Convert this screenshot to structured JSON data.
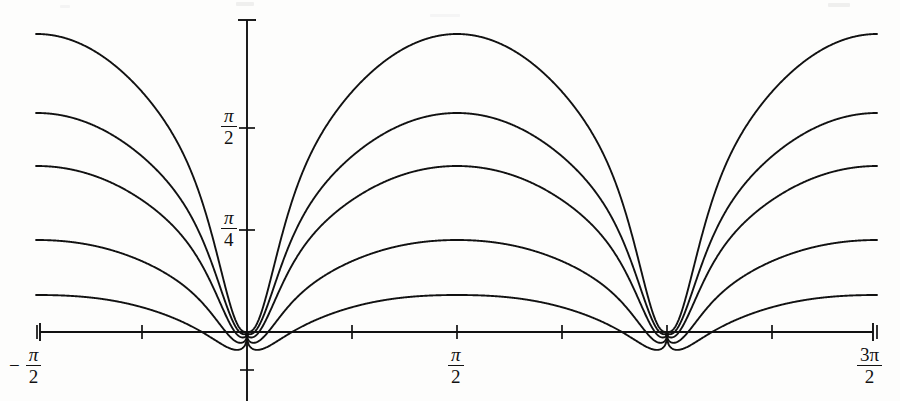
{
  "figure": {
    "background_color": "#fdfdfc",
    "ink_color": "#111111",
    "width": 900,
    "height": 401
  },
  "axes": {
    "x_axis_name": "x-axis",
    "y_axis_name": "y-axis",
    "x_axis_y_pixel": 332,
    "y_axis_x_pixel": 247,
    "x_axis_left_pixel": 40,
    "x_axis_right_pixel": 873,
    "y_axis_top_pixel": 20,
    "pixels_per_pi_x": 420,
    "pixels_per_pi_over_4_y": 102
  },
  "x_ticks": [
    {
      "label": "-pi/2",
      "sign": "−",
      "numerator": "π",
      "denominator": "2",
      "x_pixel": 40,
      "has_text": true
    },
    {
      "label": "-pi/4",
      "sign": "",
      "numerator": "",
      "denominator": "",
      "x_pixel": 144,
      "has_text": false
    },
    {
      "label": "0",
      "sign": "",
      "numerator": "",
      "denominator": "",
      "x_pixel": 247,
      "has_text": false
    },
    {
      "label": "pi/4",
      "sign": "",
      "numerator": "",
      "denominator": "",
      "x_pixel": 352,
      "has_text": false
    },
    {
      "label": "pi/2",
      "sign": "",
      "numerator": "π",
      "denominator": "2",
      "x_pixel": 457,
      "has_text": true
    },
    {
      "label": "3pi/4",
      "sign": "",
      "numerator": "",
      "denominator": "",
      "x_pixel": 562,
      "has_text": false
    },
    {
      "label": "pi",
      "sign": "",
      "numerator": "",
      "denominator": "",
      "x_pixel": 667,
      "has_text": false
    },
    {
      "label": "5pi/4",
      "sign": "",
      "numerator": "",
      "denominator": "",
      "x_pixel": 770,
      "has_text": false
    },
    {
      "label": "3pi/2",
      "sign": "",
      "numerator": "3π",
      "denominator": "2",
      "x_pixel": 873,
      "has_text": true
    }
  ],
  "y_ticks": [
    {
      "label": "pi/4",
      "numerator": "π",
      "denominator": "4",
      "y_pixel": 230
    },
    {
      "label": "pi/2",
      "numerator": "π",
      "denominator": "2",
      "y_pixel": 128
    }
  ],
  "chart_data": {
    "type": "line",
    "title": "",
    "subtitle": "",
    "xlabel": "",
    "ylabel": "",
    "grid": false,
    "legend": "none",
    "xlim": [
      -1.5707963,
      4.712389
    ],
    "ylim": [
      -0.22,
      1.78
    ],
    "xtick_values": [
      -1.5707963,
      -0.7853982,
      0,
      0.7853982,
      1.5707963,
      2.3561945,
      3.1415927,
      3.9269908,
      4.712389
    ],
    "xtick_labels": [
      "−π/2",
      "",
      "",
      "",
      "π/2",
      "",
      "",
      "",
      "3π/2"
    ],
    "ytick_values": [
      0.7853982,
      1.5707963
    ],
    "ytick_labels": [
      "π/4",
      "π/2"
    ],
    "cusp_x_values": [
      0,
      3.1415927
    ],
    "peak_x_values": [
      1.5707963
    ],
    "series": [
      {
        "name": "curve-1",
        "parameter": "k=1",
        "peak_value": 1.46,
        "peak_y_pixel": 34,
        "left_edge_y_pixel": 32,
        "min_value": 0.0,
        "min_y_pixel": 332,
        "dip_depth_pixel": 0
      },
      {
        "name": "curve-2",
        "parameter": "k=2",
        "peak_value": 1.15,
        "peak_y_pixel": 113,
        "left_edge_y_pixel": 112,
        "min_value": -0.02,
        "min_y_pixel": 340,
        "dip_depth_pixel": 8
      },
      {
        "name": "curve-3",
        "parameter": "k=3",
        "peak_value": 0.94,
        "peak_y_pixel": 166,
        "left_edge_y_pixel": 165,
        "min_value": -0.05,
        "min_y_pixel": 350,
        "dip_depth_pixel": 18
      },
      {
        "name": "curve-4",
        "parameter": "k=4",
        "peak_value": 0.65,
        "peak_y_pixel": 240,
        "left_edge_y_pixel": 238,
        "min_value": -0.09,
        "min_y_pixel": 364,
        "dip_depth_pixel": 32
      },
      {
        "name": "curve-5",
        "parameter": "k=5",
        "peak_value": 0.44,
        "peak_y_pixel": 295,
        "left_edge_y_pixel": 292,
        "min_value": -0.14,
        "min_y_pixel": 380,
        "dip_depth_pixel": 48
      }
    ]
  }
}
